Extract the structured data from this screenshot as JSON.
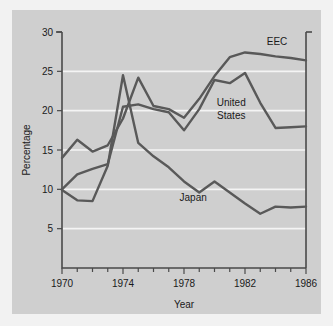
{
  "chart_data": {
    "type": "line",
    "title": "",
    "xlabel": "Year",
    "ylabel": "Percentage",
    "xlim": [
      1970,
      1986
    ],
    "ylim": [
      0,
      30
    ],
    "yticks": [
      5,
      10,
      15,
      20,
      25,
      30
    ],
    "ytick_labels": [
      "5",
      "10",
      "15",
      "20",
      "25",
      "30"
    ],
    "xticks": [
      1970,
      1974,
      1978,
      1982,
      1986
    ],
    "xtick_labels": [
      "1970",
      "1974",
      "1978",
      "1982",
      "1986"
    ],
    "xminor_step": 1,
    "grid": "horizontal",
    "legend": "inline-annotations",
    "x": [
      1970,
      1971,
      1972,
      1973,
      1974,
      1975,
      1976,
      1977,
      1978,
      1979,
      1980,
      1981,
      1982,
      1983,
      1984,
      1985,
      1986
    ],
    "series": [
      {
        "name": "EEC",
        "label": "EEC",
        "color": "#595959",
        "label_x": 1984.1,
        "label_y": 28.3,
        "values": [
          14.0,
          16.3,
          14.8,
          15.6,
          19.0,
          24.2,
          20.6,
          20.2,
          19.1,
          21.5,
          24.4,
          26.8,
          27.4,
          27.2,
          26.9,
          26.7,
          26.4
        ]
      },
      {
        "name": "United States",
        "label": "United\nStates",
        "color": "#595959",
        "label_x": 1981.1,
        "label_y": 20.6,
        "values": [
          10.0,
          11.9,
          12.6,
          13.2,
          20.5,
          20.8,
          20.2,
          19.8,
          17.5,
          20.2,
          23.9,
          23.5,
          24.8,
          21.0,
          17.8,
          17.9,
          18.0
        ]
      },
      {
        "name": "Japan",
        "label": "Japan",
        "color": "#595959",
        "label_x": 1978.6,
        "label_y": 8.5,
        "values": [
          9.9,
          8.6,
          8.5,
          13.0,
          24.5,
          15.9,
          14.2,
          12.8,
          11.0,
          9.6,
          11.0,
          9.6,
          8.2,
          6.9,
          7.8,
          7.7,
          7.8
        ]
      }
    ]
  },
  "axis": {
    "y_title": "Percentage",
    "x_title": "Year"
  }
}
